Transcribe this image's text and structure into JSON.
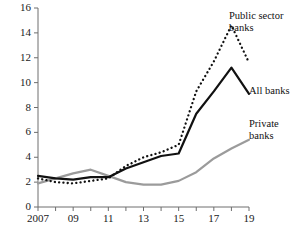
{
  "chart_data": {
    "type": "line",
    "title": "",
    "xlabel": "",
    "ylabel": "",
    "xlim": [
      2007,
      2019
    ],
    "ylim": [
      0,
      16
    ],
    "yticks": [
      0,
      2,
      4,
      6,
      8,
      10,
      12,
      14,
      16
    ],
    "ytick_labels": [
      "0",
      "2",
      "4",
      "6",
      "8",
      "10",
      "12",
      "14",
      "16"
    ],
    "xticks": [
      2007,
      2008,
      2009,
      2010,
      2011,
      2012,
      2013,
      2014,
      2015,
      2016,
      2017,
      2018,
      2019
    ],
    "xtick_labels": [
      "2007",
      "",
      "09",
      "",
      "11",
      "",
      "13",
      "",
      "15",
      "",
      "17",
      "",
      "19"
    ],
    "grid": false,
    "legend": "inline-annotations",
    "x": [
      2007,
      2008,
      2009,
      2010,
      2011,
      2012,
      2013,
      2014,
      2015,
      2016,
      2017,
      2018,
      2019
    ],
    "series": [
      {
        "name": "Public sector banks",
        "style": "dotted",
        "color": "#111111",
        "values": [
          2.3,
          2.0,
          1.9,
          2.1,
          2.3,
          3.3,
          4.0,
          4.4,
          5.0,
          9.3,
          11.7,
          14.6,
          11.6
        ]
      },
      {
        "name": "All banks",
        "style": "solid",
        "color": "#111111",
        "values": [
          2.5,
          2.3,
          2.2,
          2.4,
          2.4,
          3.1,
          3.6,
          4.1,
          4.3,
          7.5,
          9.3,
          11.2,
          9.1
        ]
      },
      {
        "name": "Private banks",
        "style": "solid",
        "color": "#9b9b9b",
        "values": [
          1.9,
          2.3,
          2.7,
          3.0,
          2.5,
          2.0,
          1.8,
          1.8,
          2.1,
          2.8,
          3.9,
          4.7,
          5.4
        ]
      }
    ],
    "annotations": [
      {
        "name": "Public sector banks",
        "text_line1": "Public sector",
        "text_line2": "banks"
      },
      {
        "name": "All banks",
        "text_line1": "All banks",
        "text_line2": ""
      },
      {
        "name": "Private banks",
        "text_line1": "Private",
        "text_line2": "banks"
      }
    ]
  },
  "axes": {
    "axis_color": "#6e6e6e",
    "public_color": "#111111",
    "all_color": "#111111",
    "private_color": "#9b9b9b"
  }
}
